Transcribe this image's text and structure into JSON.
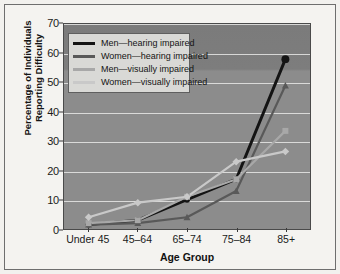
{
  "chart_data": {
    "type": "line",
    "title": "",
    "xlabel": "Age Group",
    "ylabel": "Percentage of Individuals Reporting Difficulty",
    "ylabel_line1": "Percentage of Individuals",
    "ylabel_line2": "Reporting Difficulty",
    "categories": [
      "Under 45",
      "45–64",
      "65–74",
      "75–84",
      "85+"
    ],
    "ylim": [
      0,
      70
    ],
    "yticks": [
      0,
      10,
      20,
      30,
      40,
      50,
      60,
      70
    ],
    "grid": true,
    "legend_position": "upper-left",
    "series": [
      {
        "name": "Men—hearing impaired",
        "color": "#141414",
        "marker": "circle",
        "values": [
          1.5,
          3,
          10,
          17,
          58
        ]
      },
      {
        "name": "Women—hearing impaired",
        "color": "#595959",
        "marker": "triangle",
        "values": [
          1.5,
          2,
          4,
          13,
          49
        ]
      },
      {
        "name": "Men—visually impaired",
        "color": "#a8a8a8",
        "marker": "square",
        "values": [
          2,
          3,
          11,
          17,
          33.5
        ]
      },
      {
        "name": "Women—visually impaired",
        "color": "#c9c9c9",
        "marker": "diamond",
        "values": [
          4,
          9,
          11,
          23,
          26.5
        ]
      }
    ]
  },
  "colors": {
    "plot_background": "#8a8a8a",
    "figure_background": "#f2f1ee",
    "gridline": "#e8e8e6",
    "legend_background": "#d9d9d6",
    "axis": "#3a3a3a"
  }
}
